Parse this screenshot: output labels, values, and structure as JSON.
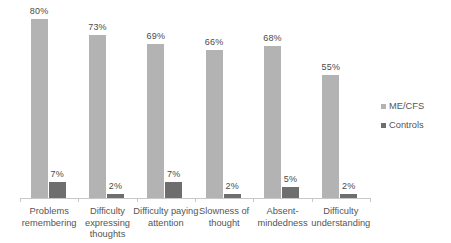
{
  "chart_data": {
    "type": "bar",
    "title": "",
    "subtitle": "",
    "xlabel": "",
    "ylabel": "",
    "ylim": [
      0,
      85
    ],
    "grid": false,
    "legend_position": "right",
    "categories": [
      "Problems remembering",
      "Difficulty expressing thoughts",
      "Difficulty paying attention",
      "Slowness of thought",
      "Absent-mindedness",
      "Difficulty understanding"
    ],
    "series": [
      {
        "name": "ME/CFS",
        "color": "#b3b3b3",
        "values": [
          80,
          73,
          69,
          66,
          68,
          55
        ],
        "labels": [
          "80%",
          "73%",
          "69%",
          "66%",
          "68%",
          "55%"
        ]
      },
      {
        "name": "Controls",
        "color": "#6e6e6e",
        "values": [
          7,
          2,
          7,
          2,
          5,
          2
        ],
        "labels": [
          "7%",
          "2%",
          "7%",
          "2%",
          "5%",
          "2%"
        ]
      }
    ]
  },
  "legend": {
    "items": [
      {
        "label": "ME/CFS",
        "color": "#b3b3b3"
      },
      {
        "label": "Controls",
        "color": "#6e6e6e"
      }
    ]
  },
  "axis": {
    "baseline_color": "#c8c8c8"
  }
}
